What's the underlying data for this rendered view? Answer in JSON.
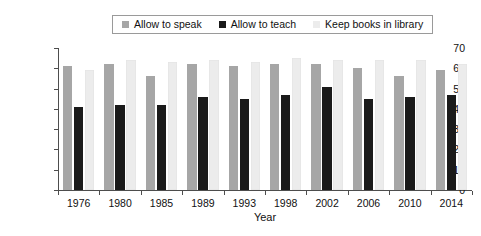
{
  "chart_data": {
    "type": "bar",
    "title": "",
    "xlabel": "Year",
    "ylabel": "Public opinion (%)",
    "categories": [
      "1976",
      "1980",
      "1985",
      "1989",
      "1993",
      "1998",
      "2002",
      "2006",
      "2010",
      "2014"
    ],
    "series": [
      {
        "name": "Allow to speak",
        "color": "#a6a6a6",
        "values": [
          61,
          62,
          56,
          62,
          61,
          62,
          62,
          60,
          56,
          59
        ]
      },
      {
        "name": "Allow to teach",
        "color": "#1a1a1a",
        "values": [
          41,
          42,
          42,
          46,
          45,
          47,
          51,
          45,
          46,
          47
        ]
      },
      {
        "name": "Keep books in library",
        "color": "#ececec",
        "values": [
          59,
          64,
          63,
          64,
          63,
          65,
          64,
          64,
          64,
          62
        ]
      }
    ],
    "ylim": [
      0,
      70
    ],
    "yticks": [
      "0",
      "10",
      "20",
      "30",
      "40",
      "50",
      "60",
      "70"
    ],
    "ytick_values": [
      0,
      10,
      20,
      30,
      40,
      50,
      60,
      70
    ],
    "grid": false,
    "legend_position": "top-center",
    "legend_border_color": "#9a9a9a",
    "axis_color": "#4d4d4d"
  },
  "legend": {
    "entries": [
      {
        "label": "Allow to speak"
      },
      {
        "label": "Allow to teach"
      },
      {
        "label": "Keep books in library"
      }
    ]
  },
  "axes": {
    "x_title": "Year",
    "y_title": "Public opinion (%)"
  }
}
